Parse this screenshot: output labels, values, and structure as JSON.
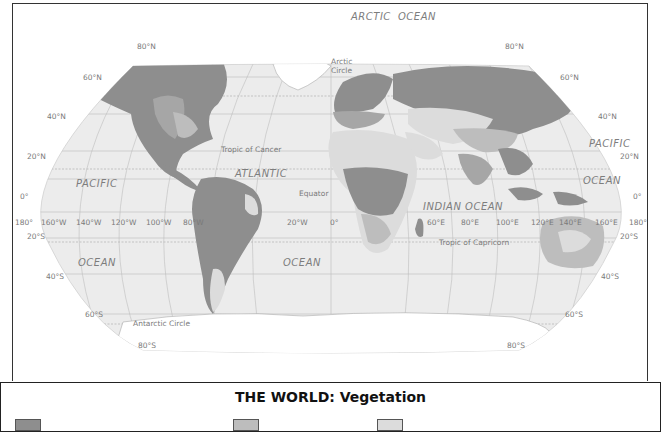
{
  "title": "THE WORLD: Vegetation",
  "colors": {
    "ocean": "#ececec",
    "ice": "#ffffff",
    "forest_dense": "#8e8e8e",
    "forest_mid": "#a6a6a6",
    "grassland": "#bdbdbd",
    "desert": "#dcdcdc",
    "grid": "#bdbdbd",
    "frame": "#333333"
  },
  "ocean_labels": {
    "arctic": "ARCTIC",
    "arctic_ocean": "OCEAN",
    "pacific_west": "PACIFIC",
    "ocean_west": "OCEAN",
    "atlantic": "ATLANTIC",
    "ocean_atlantic": "OCEAN",
    "indian": "INDIAN OCEAN",
    "pacific_east": "PACIFIC",
    "ocean_east": "OCEAN"
  },
  "circle_labels": {
    "arctic_circle_1": "Arctic",
    "arctic_circle_2": "Circle",
    "tropic_cancer": "Tropic of Cancer",
    "equator": "Equator",
    "tropic_capricorn": "Tropic of Capricorn",
    "antarctic_circle": "Antarctic Circle"
  },
  "latitude_labels": {
    "n80_w": "80°N",
    "n60_w": "60°N",
    "n40_w": "40°N",
    "n20_w": "20°N",
    "eq_w": "0°",
    "s20_w": "20°S",
    "s40_w": "40°S",
    "s60_w": "60°S",
    "s80_w": "80°S",
    "n80_e": "80°N",
    "n60_e": "60°N",
    "n40_e": "40°N",
    "n20_e": "20°N",
    "eq_e": "0°",
    "s20_e": "20°S",
    "s40_e": "40°S",
    "s60_e": "60°S",
    "s80_e": "80°S"
  },
  "longitude_labels": [
    "180°",
    "160°W",
    "140°W",
    "120°W",
    "100°W",
    "80°W",
    "20°W",
    "0°",
    "60°E",
    "80°E",
    "100°E",
    "120°E",
    "140°E",
    "160°E",
    "180°"
  ],
  "legend": {
    "swatches": [
      {
        "color": "#8e8e8e"
      },
      {
        "color": "#bdbdbd"
      },
      {
        "color": "#dcdcdc"
      }
    ]
  }
}
